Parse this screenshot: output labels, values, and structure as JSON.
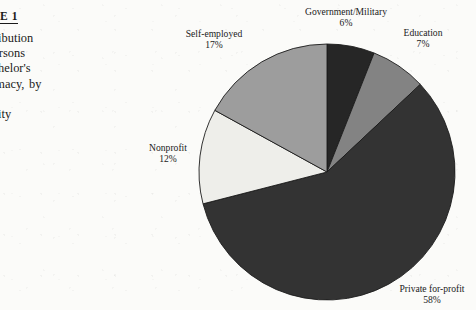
{
  "figure": {
    "heading": "E 1",
    "caption_lines": [
      "tage  Distribution",
      "ployed  Persons",
      "nly a Bachelor's",
      "e in Pharmacy, by",
      "Sector  of",
      "mic Activity"
    ]
  },
  "chart_data": {
    "type": "pie",
    "title": "",
    "categories": [
      "Government/Military",
      "Education",
      "Private for-profit",
      "Nonprofit",
      "Self-employed"
    ],
    "values": [
      6,
      7,
      58,
      12,
      17
    ],
    "value_suffix": "%",
    "start_angle_deg": 0,
    "direction": "clockwise",
    "legend": "none",
    "labels": [
      {
        "name": "Government/Military",
        "value": "6%",
        "left": 291,
        "top": 6,
        "width": 110
      },
      {
        "name": "Education",
        "value": "7%",
        "left": 392,
        "top": 27,
        "width": 62
      },
      {
        "name": "Self-employed",
        "value": "17%",
        "left": 178,
        "top": 28,
        "width": 72
      },
      {
        "name": "Nonprofit",
        "value": "12%",
        "left": 140,
        "top": 142,
        "width": 56
      },
      {
        "name": "Private for-profit",
        "value": "58%",
        "left": 388,
        "top": 283,
        "width": 88
      }
    ],
    "slices": [
      {
        "name": "Government/Military",
        "percent": 6,
        "color": "#262626"
      },
      {
        "name": "Education",
        "percent": 7,
        "color": "#838383"
      },
      {
        "name": "Private for-profit",
        "percent": 58,
        "color": "#333333"
      },
      {
        "name": "Nonprofit",
        "percent": 12,
        "color": "#eeeeea"
      },
      {
        "name": "Self-employed",
        "percent": 17,
        "color": "#9d9d9d"
      }
    ],
    "geometry": {
      "cx": 327,
      "cy": 172,
      "r": 128
    },
    "stroke_color": "#1c1c1c"
  }
}
